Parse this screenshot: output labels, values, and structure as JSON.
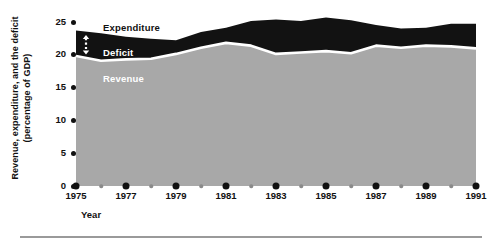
{
  "chart_data": {
    "type": "area",
    "title": "",
    "subtitle": "",
    "xlabel": "Year",
    "ylabel": "Revenue, expenditure, and the deficit (percentage of GDP)",
    "ylabel_lines": [
      "Revenue, expenditure, and the deficit",
      "(percentage of GDP)"
    ],
    "grid": false,
    "legend_position": "inside-plot",
    "stacked": true,
    "xlim": [
      1975,
      1991
    ],
    "ylim": [
      0,
      25
    ],
    "yticks": [
      0,
      5,
      10,
      15,
      20,
      25
    ],
    "ytick_labels": [
      "0",
      "5",
      "10",
      "15",
      "20",
      "25"
    ],
    "x": [
      1975,
      1976,
      1977,
      1978,
      1979,
      1980,
      1981,
      1982,
      1983,
      1984,
      1985,
      1986,
      1987,
      1988,
      1989,
      1990,
      1991
    ],
    "xtick_major": [
      1975,
      1977,
      1979,
      1981,
      1983,
      1985,
      1987,
      1989,
      1991
    ],
    "xtick_minor": [
      1976,
      1978,
      1980,
      1982,
      1984,
      1986,
      1988,
      1990
    ],
    "xtick_labels": [
      "1975",
      "1977",
      "1979",
      "1981",
      "1983",
      "1985",
      "1987",
      "1989",
      "1991"
    ],
    "series": [
      {
        "name": "Revenue",
        "label": "Revenue",
        "color": "#a8a8a8",
        "values": [
          18.9,
          18.2,
          18.4,
          18.5,
          19.2,
          20.1,
          20.8,
          20.4,
          19.2,
          19.4,
          19.6,
          19.3,
          20.4,
          20.1,
          20.4,
          20.3,
          20.0
        ]
      },
      {
        "name": "Deficit",
        "label": "Deficit",
        "color": "#121212",
        "values": [
          3.7,
          4.0,
          3.3,
          2.9,
          2.0,
          2.3,
          2.2,
          3.6,
          5.0,
          4.6,
          4.9,
          4.8,
          3.0,
          2.8,
          2.6,
          3.3,
          3.6
        ]
      }
    ],
    "top_line": {
      "name": "Expenditure",
      "label": "Expenditure",
      "values": [
        22.6,
        22.2,
        21.7,
        21.4,
        21.2,
        22.4,
        23.0,
        24.0,
        24.2,
        24.0,
        24.5,
        24.1,
        23.4,
        22.9,
        23.0,
        23.6,
        23.6
      ]
    },
    "annotations": [
      {
        "name": "deficit-arrow",
        "type": "double-arrow-dotted",
        "color": "#ffffff",
        "x": 1975.4
      }
    ]
  },
  "labels": {
    "expenditure": "Expenditure",
    "deficit": "Deficit",
    "revenue": "Revenue"
  },
  "colors": {
    "revenue_fill": "#a8a8a8",
    "deficit_fill": "#121212",
    "separator": "#ffffff",
    "axis_text": "#111111",
    "minor_tick": "#8a8a8a",
    "rule": "#9a9a9a",
    "background": "#ffffff"
  }
}
